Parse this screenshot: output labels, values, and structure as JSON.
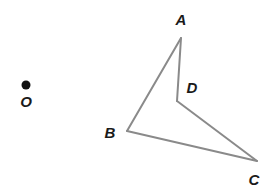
{
  "figure": {
    "width": 268,
    "height": 192,
    "background_color": "#ffffff",
    "stroke_color": "#8a8a8a",
    "stroke_width": 2,
    "label_color": "#1a1a1a",
    "point_color": "#111111",
    "center_point": {
      "name": "O",
      "label": "O",
      "x": 26,
      "y": 85,
      "radius": 4.5,
      "label_x": 26,
      "label_y": 101
    },
    "vertices": [
      {
        "name": "A",
        "label": "A",
        "x": 181,
        "y": 38,
        "label_x": 181,
        "label_y": 19
      },
      {
        "name": "B",
        "label": "B",
        "x": 127,
        "y": 131,
        "label_x": 110,
        "label_y": 132
      },
      {
        "name": "C",
        "label": "C",
        "x": 257,
        "y": 161,
        "label_x": 254,
        "label_y": 179
      },
      {
        "name": "D",
        "label": "D",
        "x": 177,
        "y": 101,
        "label_x": 192,
        "label_y": 87
      }
    ],
    "edges": [
      {
        "name": "edge-AB",
        "from": "A",
        "to": "B",
        "d": "M 181 38 L 127 131"
      },
      {
        "name": "edge-BC",
        "from": "B",
        "to": "C",
        "d": "M 127 131 L 257 161"
      },
      {
        "name": "edge-CD",
        "from": "C",
        "to": "D",
        "d": "M 257 161 L 177 101"
      },
      {
        "name": "edge-DA",
        "from": "D",
        "to": "A",
        "d": "M 177 101 L 181 38"
      }
    ],
    "outline_path": "M 181 38 L 127 131 L 257 161 L 177 101 Z"
  }
}
